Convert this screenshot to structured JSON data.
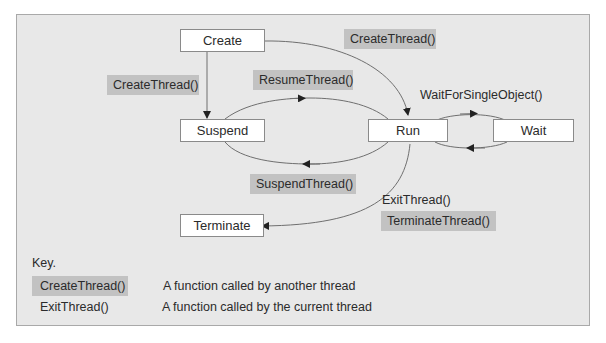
{
  "diagram": {
    "states": {
      "create": "Create",
      "suspend": "Suspend",
      "run": "Run",
      "wait": "Wait",
      "terminate": "Terminate"
    },
    "transitions": {
      "create_to_suspend": "CreateThread()",
      "create_to_run": "CreateThread()",
      "suspend_to_run": "ResumeThread()",
      "run_to_suspend": "SuspendThread()",
      "run_wait": "WaitForSingleObject()",
      "run_to_terminate_self": "ExitThread()",
      "run_to_terminate_other": "TerminateThread()"
    },
    "colors": {
      "frame_bg": "#e8e8e8",
      "frame_border": "#a9a9a9",
      "state_bg": "#ffffff",
      "other_thread_fn_bg": "#c2c2c2",
      "line": "#6f6f6f"
    }
  },
  "key": {
    "title": "Key.",
    "items": [
      {
        "sample": "CreateThread()",
        "description": "A function called by another thread",
        "style": "shaded"
      },
      {
        "sample": "ExitThread()",
        "description": "A function called by the current thread",
        "style": "plain"
      }
    ]
  }
}
